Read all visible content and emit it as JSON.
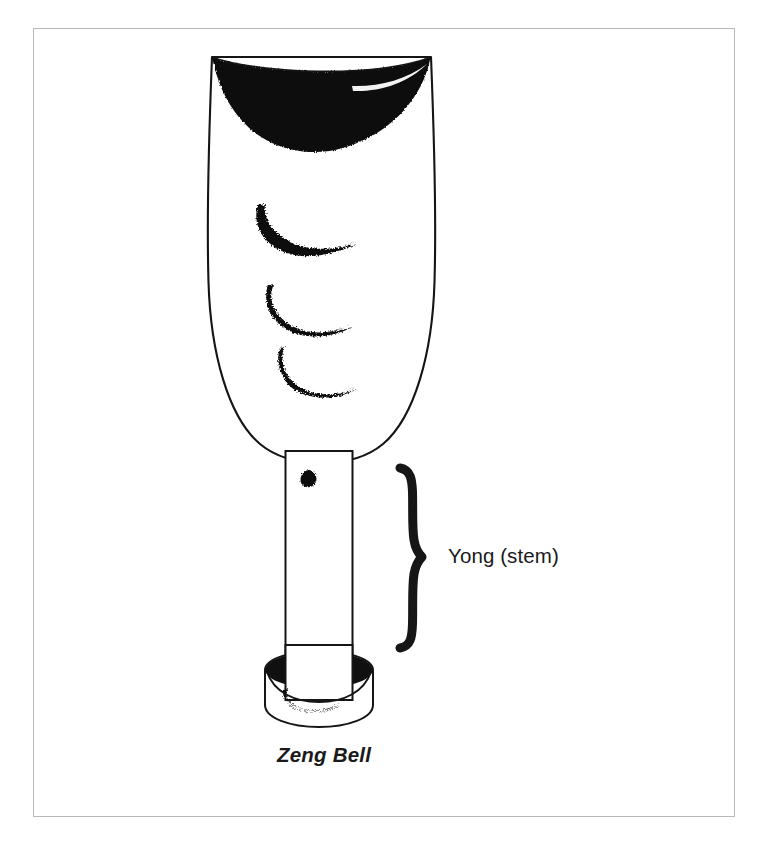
{
  "figure": {
    "name": "Zeng Bell labeled diagram",
    "background_color": "#ffffff",
    "ink_color": "#111111",
    "frame_color": "#b9b9bd",
    "caption": "Zeng Bell",
    "annotation_label": "Yong (stem)",
    "brace_icon": "curly-brace-right-icon",
    "parts": [
      {
        "name": "bell-body",
        "description": "Elongated rounded bell resonator with flat top rim",
        "marks": 3,
        "mark_shape": "crescent-brush-stroke"
      },
      {
        "name": "bell-mouth",
        "description": "Concave crescent opening filled solid black at the top"
      },
      {
        "name": "yong-stem",
        "description": "Vertical cylindrical shank below the bell body",
        "marks": 1,
        "mark_shape": "small-ink-blot"
      },
      {
        "name": "base-collar",
        "description": "Cylindrical mounting collar at the bottom of the stem",
        "marks": 1,
        "mark_shape": "crescent-brush-stroke"
      }
    ]
  },
  "labels": {
    "yong": "Yong (stem)",
    "zeng": "Zeng Bell"
  }
}
